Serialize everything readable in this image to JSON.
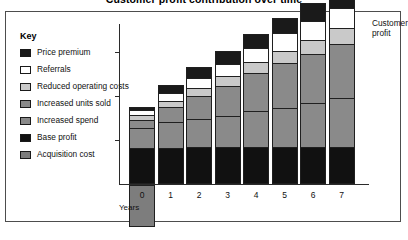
{
  "figure": {
    "title": "Customer profit contribution over time",
    "key_heading": "Key",
    "callout": "Customer\nprofit",
    "callout_line1": "Customer",
    "callout_line2": "profit"
  },
  "legend": {
    "items": [
      {
        "label": "Price premium",
        "color": "#1a1a1a"
      },
      {
        "label": "Referrals",
        "color": "#ffffff"
      },
      {
        "label": "Reduced operating costs",
        "color": "#c9c9c9"
      },
      {
        "label": "Increased units sold",
        "color": "#8a8a8a"
      },
      {
        "label": "Increased spend",
        "color": "#8a8a8a"
      },
      {
        "label": "Base profit",
        "color": "#111111"
      },
      {
        "label": "Acquisition cost",
        "color": "#7d7d7d"
      }
    ]
  },
  "chart_data": {
    "type": "bar",
    "subtype": "stacked-bar",
    "title": "Customer profit contribution over time",
    "xlabel": "Years",
    "ylabel": "",
    "categories": [
      "0",
      "1",
      "2",
      "3",
      "4",
      "5",
      "6",
      "7"
    ],
    "grid": false,
    "legend_position": "left",
    "ylim": [
      -28,
      100
    ],
    "y_tick_count": 3,
    "y_tick_labels": [],
    "series": [
      {
        "name": "Base profit",
        "color": "#111111",
        "values": [
          22,
          22,
          22,
          22,
          22,
          22,
          22,
          22
        ]
      },
      {
        "name": "Increased spend",
        "color": "#8a8a8a",
        "values": [
          13,
          16,
          18,
          20,
          23,
          25,
          28,
          31
        ]
      },
      {
        "name": "Increased units sold",
        "color": "#8a8a8a",
        "values": [
          5,
          10,
          15,
          19,
          24,
          28,
          31,
          34
        ]
      },
      {
        "name": "Reduced operating costs",
        "color": "#c9c9c9",
        "values": [
          3,
          4,
          5,
          6,
          7,
          8,
          9,
          10
        ]
      },
      {
        "name": "Referrals",
        "color": "#ffffff",
        "values": [
          3,
          5,
          6,
          8,
          9,
          11,
          12,
          13
        ]
      },
      {
        "name": "Price premium",
        "color": "#1a1a1a",
        "values": [
          2,
          5,
          7,
          8,
          9,
          10,
          11,
          12
        ]
      }
    ],
    "totals": [
      48,
      62,
      73,
      83,
      94,
      104,
      113,
      122
    ],
    "below_axis": {
      "name": "Acquisition cost",
      "color": "#7d7d7d",
      "category": "0",
      "value": -26
    },
    "annotations": [
      {
        "text": "Customer profit",
        "target_category": "7",
        "position": "right"
      }
    ]
  }
}
